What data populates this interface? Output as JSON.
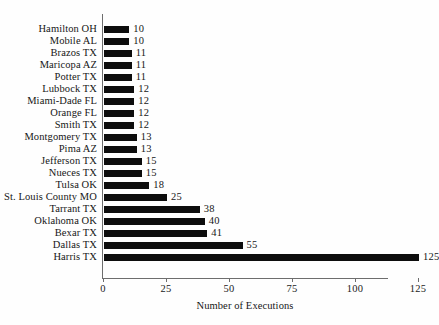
{
  "chart_data": {
    "type": "bar",
    "orientation": "horizontal",
    "title": "",
    "xlabel": "Number of Executions",
    "ylabel": "",
    "xlim": [
      0,
      125
    ],
    "xticks": [
      0,
      25,
      50,
      75,
      100,
      125
    ],
    "grid": false,
    "legend": false,
    "bar_color": "#0d0d0d",
    "axis_color": "#6d6d6d",
    "categories": [
      "Hamilton OH",
      "Mobile AL",
      "Brazos TX",
      "Maricopa AZ",
      "Potter TX",
      "Lubbock TX",
      "Miami-Dade FL",
      "Orange FL",
      "Smith TX",
      "Montgomery TX",
      "Pima AZ",
      "Jefferson TX",
      "Nueces TX",
      "Tulsa OK",
      "St. Louis County MO",
      "Tarrant TX",
      "Oklahoma OK",
      "Bexar TX",
      "Dallas TX",
      "Harris TX"
    ],
    "values": [
      10,
      10,
      11,
      11,
      11,
      12,
      12,
      12,
      12,
      13,
      13,
      15,
      15,
      18,
      25,
      38,
      40,
      41,
      55,
      125
    ],
    "value_labels": [
      "10",
      "10",
      "11",
      "11",
      "11",
      "12",
      "12",
      "12",
      "12",
      "13",
      "13",
      "15",
      "15",
      "18",
      "25",
      "38",
      "40",
      "41",
      "55",
      "125"
    ]
  }
}
